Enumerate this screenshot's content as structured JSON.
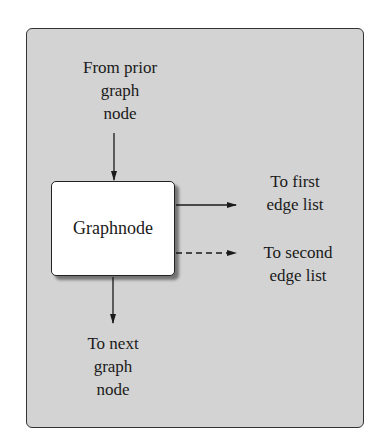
{
  "diagram": {
    "node": {
      "label": "Graphnode"
    },
    "labels": {
      "from_prior": [
        "From prior",
        "graph",
        "node"
      ],
      "first_edge": [
        "To first",
        "edge list"
      ],
      "second_edge": [
        "To second",
        "edge list"
      ],
      "to_next": [
        "To next",
        "graph",
        "node"
      ]
    },
    "edges": [
      {
        "from": "From prior graph node",
        "to": "Graphnode",
        "style": "solid"
      },
      {
        "from": "Graphnode",
        "to": "To first edge list",
        "style": "solid"
      },
      {
        "from": "Graphnode",
        "to": "To second edge list",
        "style": "dashed"
      },
      {
        "from": "Graphnode",
        "to": "To next graph node",
        "style": "solid"
      }
    ],
    "colors": {
      "panel": "#d3d3d3",
      "node_fill": "#ffffff",
      "stroke": "#1a1a1a"
    }
  }
}
